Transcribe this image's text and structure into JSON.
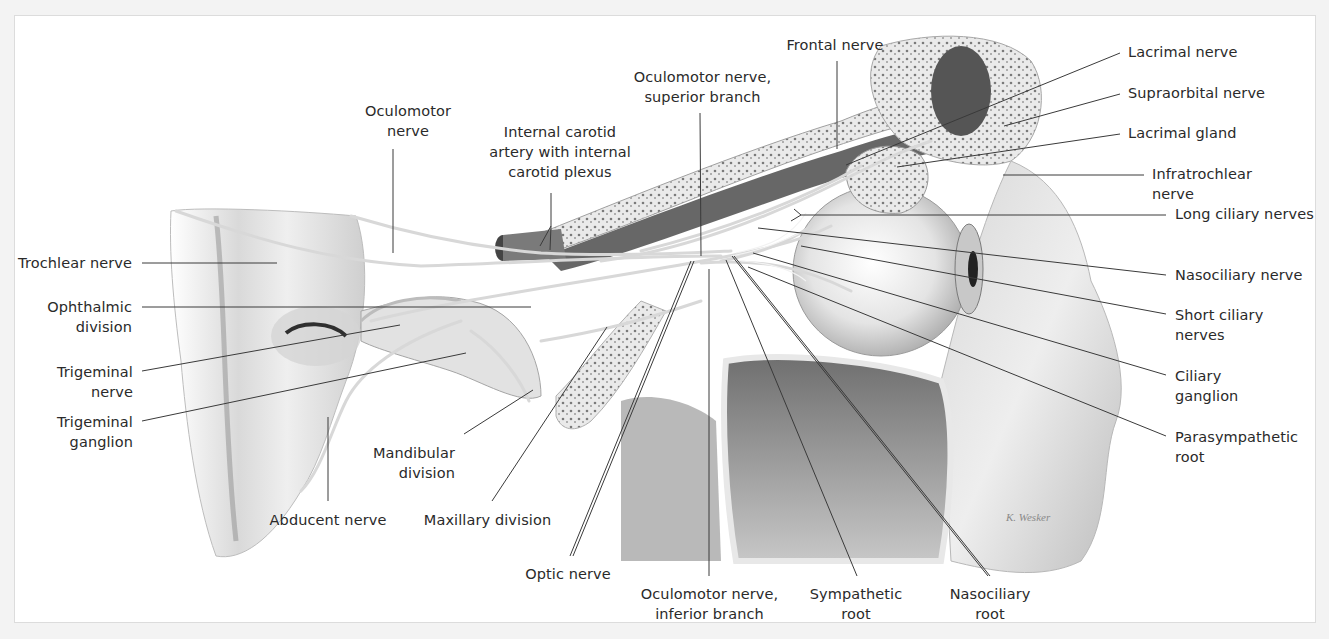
{
  "figure": {
    "signature": "K. Wesker",
    "colors": {
      "background": "#ffffff",
      "page": "#f3f3f3",
      "label_text": "#2a2a2a",
      "leader_line": "#3a3a3a"
    }
  },
  "labels": {
    "oculomotor_nerve": [
      "Oculomotor",
      "nerve"
    ],
    "internal_carotid": [
      "Internal carotid",
      "artery with internal",
      "carotid plexus"
    ],
    "oculomotor_superior": [
      "Oculomotor nerve,",
      "superior branch"
    ],
    "frontal_nerve": [
      "Frontal nerve"
    ],
    "lacrimal_nerve": [
      "Lacrimal nerve"
    ],
    "supraorbital_nerve": [
      "Supraorbital nerve"
    ],
    "lacrimal_gland": [
      "Lacrimal gland"
    ],
    "infratrochlear_nerve": [
      "Infratrochlear",
      "nerve"
    ],
    "long_ciliary_nerves": [
      "Long ciliary nerves"
    ],
    "nasociliary_nerve": [
      "Nasociliary nerve"
    ],
    "short_ciliary_nerves": [
      "Short ciliary",
      "nerves"
    ],
    "ciliary_ganglion": [
      "Ciliary",
      "ganglion"
    ],
    "parasympathetic_root": [
      "Parasympathetic",
      "root"
    ],
    "trochlear_nerve": [
      "Trochlear nerve"
    ],
    "ophthalmic_division": [
      "Ophthalmic",
      "division"
    ],
    "trigeminal_nerve": [
      "Trigeminal",
      "nerve"
    ],
    "trigeminal_ganglion": [
      "Trigeminal",
      "ganglion"
    ],
    "abducent_nerve": [
      "Abducent nerve"
    ],
    "mandibular_division": [
      "Mandibular",
      "division"
    ],
    "maxillary_division": [
      "Maxillary division"
    ],
    "optic_nerve": [
      "Optic nerve"
    ],
    "oculomotor_inferior": [
      "Oculomotor nerve,",
      "inferior branch"
    ],
    "sympathetic_root": [
      "Sympathetic",
      "root"
    ],
    "nasociliary_root": [
      "Nasociliary",
      "root"
    ]
  }
}
